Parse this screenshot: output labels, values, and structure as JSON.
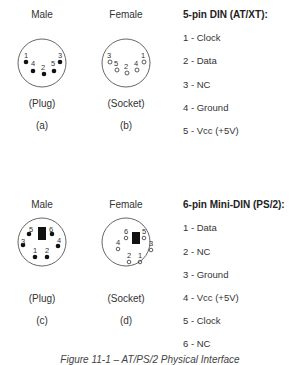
{
  "top_section": {
    "male": {
      "heading": "Male",
      "type": "(Plug)",
      "letter": "(a)",
      "pins": [
        {
          "n": "1",
          "x": 25,
          "y": 62,
          "lx": 22,
          "ly": 57
        },
        {
          "n": "4",
          "x": 33,
          "y": 70,
          "lx": 31,
          "ly": 65
        },
        {
          "n": "2",
          "x": 44,
          "y": 74,
          "lx": 42,
          "ly": 68
        },
        {
          "n": "5",
          "x": 54,
          "y": 70,
          "lx": 51,
          "ly": 65
        },
        {
          "n": "3",
          "x": 60,
          "y": 62,
          "lx": 58,
          "ly": 57
        }
      ]
    },
    "female": {
      "heading": "Female",
      "type": "(Socket)",
      "letter": "(b)"
    },
    "pinout": {
      "title": "5-pin DIN (AT/XT):",
      "pins": [
        "1 - Clock",
        "2 - Data",
        "3 - NC",
        "4 - Ground",
        "5 - Vcc (+5V)"
      ]
    }
  },
  "bottom_section": {
    "male": {
      "heading": "Male",
      "type": "(Plug)",
      "letter": "(c)"
    },
    "female": {
      "heading": "Female",
      "type": "(Socket)",
      "letter": "(d)"
    },
    "pinout": {
      "title": "6-pin Mini-DIN (PS/2):",
      "pins": [
        "1 - Data",
        "2 - NC",
        "3 - Ground",
        "4 - Vcc (+5V)",
        "5 - Clock",
        "6 - NC"
      ]
    }
  },
  "caption": "Figure 11-1 – AT/PS/2 Physical Interface"
}
